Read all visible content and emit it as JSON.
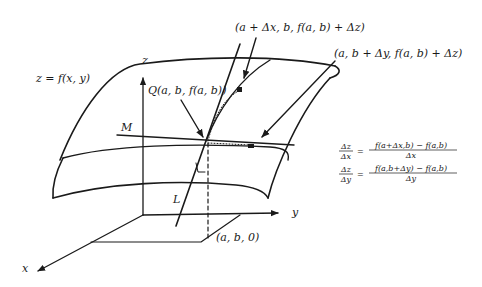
{
  "figure": {
    "surface_label": "z = f(x, y)",
    "axes": {
      "x": "x",
      "y": "y",
      "z": "z"
    },
    "points": {
      "Q": "Q(a, b, f(a, b))",
      "x_shift": "(a + Δx, b, f(a, b) + Δz)",
      "y_shift": "(a, b + Δy, f(a, b) + Δz)",
      "base": "(a, b, 0)"
    },
    "lines": {
      "M": "M",
      "L": "L"
    },
    "equations": [
      {
        "lhs_num": "Δz",
        "lhs_den": "Δx",
        "eq": "=",
        "rhs_num": "f(a+Δx,b) − f(a,b)",
        "rhs_den": "Δx"
      },
      {
        "lhs_num": "Δz",
        "lhs_den": "Δy",
        "eq": "=",
        "rhs_num": "f(a,b+Δy) − f(a,b)",
        "rhs_den": "Δy"
      }
    ]
  }
}
